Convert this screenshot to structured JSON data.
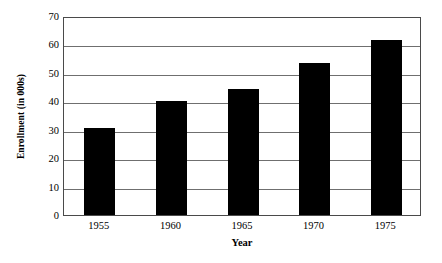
{
  "chart_data": {
    "type": "bar",
    "title": "",
    "xlabel": "Year",
    "ylabel": "Enrollment (in 000s)",
    "categories": [
      "1955",
      "1960",
      "1965",
      "1970",
      "1975"
    ],
    "values": [
      30.6,
      40.1,
      44.4,
      53.5,
      61.6
    ],
    "series": [
      {
        "name": "Enrollment",
        "values": [
          30.6,
          40.1,
          44.4,
          53.5,
          61.6
        ]
      }
    ],
    "ylim": [
      0,
      70
    ],
    "yticks": [
      0,
      10,
      20,
      30,
      40,
      50,
      60,
      70
    ],
    "ytick_labels": [
      "0",
      "10",
      "20",
      "30",
      "40",
      "50",
      "60",
      "70"
    ],
    "xtick_labels": [
      "1955",
      "1960",
      "1965",
      "1970",
      "1975"
    ],
    "grid": "horizontal",
    "legend": "none",
    "bar_color": "#000000",
    "gridline_color": "#6f6f6f",
    "frame_color": "#4a4a4a",
    "background_color": "#ffffff",
    "annotations": []
  }
}
